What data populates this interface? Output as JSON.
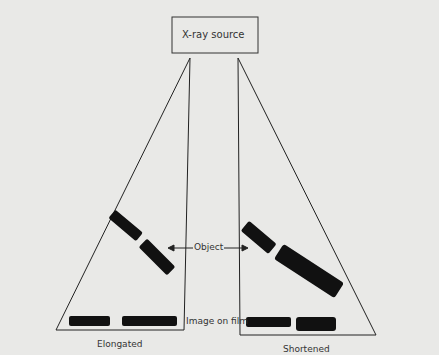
{
  "source": {
    "label": "X-ray source"
  },
  "labels": {
    "object": "Object",
    "image_on_film": "Image on film",
    "left_caption": "Elongated",
    "right_caption": "Shortened"
  },
  "colors": {
    "background": "#e9e9e7",
    "ink": "#111111",
    "line": "#222222"
  }
}
